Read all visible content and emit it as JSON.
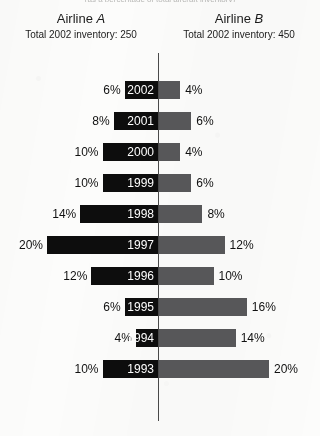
{
  "supertitle": "(as a percentage of total aircraft inventory)",
  "header": {
    "left": {
      "airline": "Airline A",
      "airline_base": "Airline",
      "airline_letter": "A",
      "subtitle": "Total 2002 inventory: 250"
    },
    "right": {
      "airline": "Airline B",
      "airline_base": "Airline",
      "airline_letter": "B",
      "subtitle": "Total 2002 inventory: 450"
    }
  },
  "colors": {
    "airline_a": "#0d0d0d",
    "airline_b": "#58585a",
    "axis": "#4a4a4a",
    "paper": "#fcfcfb",
    "text": "#141414",
    "year_text": "#ffffff"
  },
  "chart_data": {
    "type": "bar",
    "subtype": "diverging-bidirectional-bar",
    "title": "",
    "xlabel": "",
    "ylabel": "",
    "categories": [
      "2002",
      "2001",
      "2000",
      "1999",
      "1998",
      "1997",
      "1996",
      "1995",
      "1994",
      "1993"
    ],
    "series": [
      {
        "name": "Airline A",
        "side": "left",
        "color": "#0d0d0d",
        "unit": "%",
        "values": [
          6,
          8,
          10,
          10,
          14,
          20,
          12,
          6,
          4,
          10
        ],
        "labels": [
          "6%",
          "8%",
          "10%",
          "10%",
          "14%",
          "20%",
          "12%",
          "6%",
          "4%",
          "10%"
        ]
      },
      {
        "name": "Airline B",
        "side": "right",
        "color": "#58585a",
        "unit": "%",
        "values": [
          4,
          6,
          4,
          6,
          8,
          12,
          10,
          16,
          14,
          20
        ],
        "labels": [
          "4%",
          "6%",
          "4%",
          "6%",
          "8%",
          "12%",
          "10%",
          "16%",
          "14%",
          "20%"
        ]
      }
    ],
    "xlim": [
      20,
      20
    ],
    "px_per_percent": 5.55,
    "axis_x_px": 158,
    "grid": false,
    "legend_position": "top"
  }
}
